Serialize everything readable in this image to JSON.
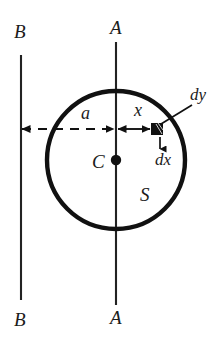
{
  "figure": {
    "kind": "physics-diagram",
    "colors": {
      "ink": "#111111",
      "background": "#ffffff"
    }
  },
  "labels": {
    "line_b_top": "B",
    "line_b_bottom": "B",
    "line_a_top": "A",
    "line_a_bottom": "A",
    "radius_a": "a",
    "distance_x": "x",
    "element_dy": "dy",
    "element_dx": "dx",
    "centre_c": "C",
    "surface_s": "S"
  },
  "geometry": {
    "line_b_x": 21,
    "line_b_y_top": 55,
    "line_b_y_bottom": 300,
    "line_a_x": 116,
    "line_a_y_top": 42,
    "line_a_y_bottom": 305,
    "circle_cx": 116,
    "circle_cy": 160,
    "circle_r": 69,
    "dim_line_y": 129,
    "element_x": 157,
    "element_y": 129,
    "element_size": 12
  }
}
